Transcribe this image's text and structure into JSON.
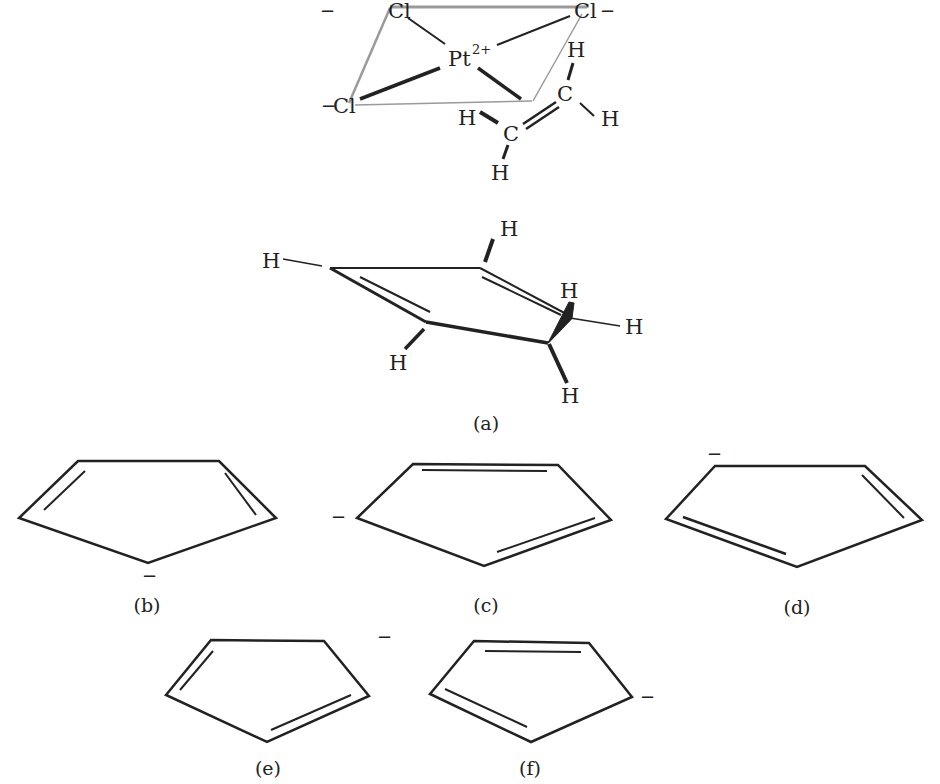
{
  "figure": {
    "complex": {
      "metal": "Pt",
      "metal_charge": "2+",
      "ligands": [
        "Cl",
        "Cl",
        "Cl"
      ],
      "ligand_charge": "−",
      "alkene_atoms": [
        "C",
        "C"
      ],
      "hydrogens": [
        "H",
        "H",
        "H",
        "H"
      ]
    },
    "cyclopentadiene": {
      "hydrogens": [
        "H",
        "H",
        "H",
        "H",
        "H",
        "H"
      ],
      "label": "(a)"
    },
    "resonance_structures": [
      {
        "label": "(b)",
        "charge": "−"
      },
      {
        "label": "(c)",
        "charge": "−"
      },
      {
        "label": "(d)",
        "charge": "−"
      },
      {
        "label": "(e)",
        "charge": "−"
      },
      {
        "label": "(f)",
        "charge": "−"
      }
    ]
  },
  "colors": {
    "ink": "#222222",
    "frame": "#9a9a9a",
    "background": "#ffffff"
  }
}
